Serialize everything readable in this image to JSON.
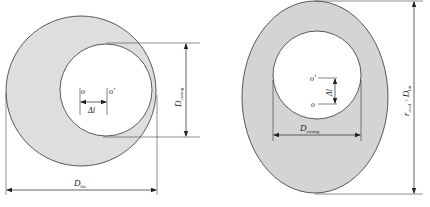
{
  "colors": {
    "fill": "#dcdcdc",
    "stroke": "#333333",
    "background": "#ffffff"
  },
  "left_figure": {
    "center_o_label": "o",
    "center_o_prime_label": "o'",
    "offset_label": "Δl",
    "casing_diameter_label": "D",
    "casing_diameter_sub": "casing",
    "bit_diameter_label": "D",
    "bit_diameter_sub": "bit"
  },
  "right_figure": {
    "center_o_label": "o",
    "center_o_prime_label": "o'",
    "offset_label": "Δl",
    "casing_diameter_label": "D",
    "casing_diameter_sub": "casing",
    "ratio_label": "r",
    "ratio_sub": "oval",
    "ratio_mid": " · D",
    "ratio_sub2": "bit"
  }
}
